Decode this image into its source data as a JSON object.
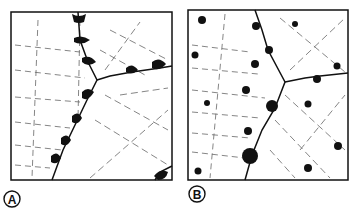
{
  "panels": [
    {
      "id": "A",
      "label": "A",
      "description": "grain boundary with lens-shaped precipitates along the boundary"
    },
    {
      "id": "B",
      "label": "B",
      "description": "grain boundary with precipitates distributed in grains and on boundary"
    }
  ],
  "colors": {
    "ink": "#111111",
    "background": "#ffffff",
    "dash": "#555555"
  }
}
